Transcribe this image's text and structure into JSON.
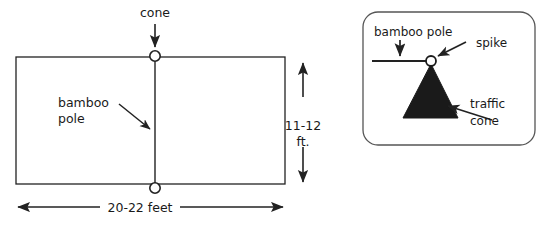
{
  "diagram": {
    "title_text": "",
    "background_color": "#ffffff",
    "ink_color": "#222222",
    "cone_fill_color": "#1a1a1a",
    "left_panel": {
      "name": "court-layout-plan-view",
      "labels": {
        "cone": "cone",
        "bamboo_pole_line1": "bamboo",
        "bamboo_pole_line2": "pole",
        "height_dimension_line1": "11-12",
        "height_dimension_line2": "ft.",
        "width_dimension": "20-22 feet"
      }
    },
    "right_panel": {
      "name": "cone-detail-inset",
      "labels": {
        "bamboo_pole": "bamboo pole",
        "spike": "spike",
        "traffic_cone_line1": "traffic",
        "traffic_cone_line2": "cone"
      }
    }
  }
}
